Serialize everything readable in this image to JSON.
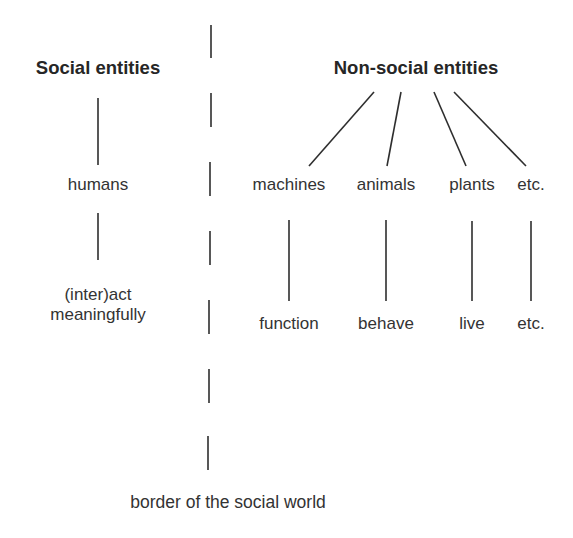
{
  "diagram": {
    "left": {
      "header": "Social entities",
      "entity": "humans",
      "action_line1": "(inter)act",
      "action_line2": "meaningfully"
    },
    "right": {
      "header": "Non-social entities",
      "entities": [
        "machines",
        "animals",
        "plants",
        "etc."
      ],
      "actions": [
        "function",
        "behave",
        "live",
        "etc."
      ]
    },
    "border_label": "border of the social world",
    "colors": {
      "line": "#2e2e2e",
      "text": "#333333",
      "background": "#ffffff"
    }
  }
}
